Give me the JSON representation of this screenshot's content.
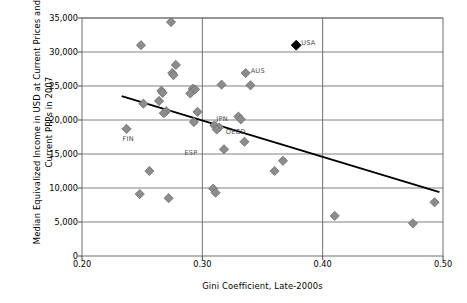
{
  "chart_data": {
    "type": "scatter",
    "title": "",
    "xlabel": "Gini Coefficient, Late-2000s",
    "ylabel": "Median Equivalized Income in USD at Current Prices and Current PPPs in 2007",
    "xlim": [
      0.2,
      0.5
    ],
    "ylim": [
      0,
      35000
    ],
    "xticks": [
      "0.20",
      "0.30",
      "0.40",
      "0.50"
    ],
    "xtick_values": [
      0.2,
      0.3,
      0.4,
      0.5
    ],
    "yticks": [
      "0",
      "5,000",
      "10,000",
      "15,000",
      "20,000",
      "25,000",
      "30,000",
      "35,000"
    ],
    "ytick_values": [
      0,
      5000,
      10000,
      15000,
      20000,
      25000,
      30000,
      35000
    ],
    "grid": "horizontal-and-vertical",
    "legend": "none",
    "marker_shape": "diamond",
    "marker_color": "#8c8c8c",
    "highlight_color": "#000000",
    "trendline_color": "#000000",
    "points": [
      {
        "x": 0.274,
        "y": 34400,
        "label": "",
        "highlight": false
      },
      {
        "x": 0.249,
        "y": 31000,
        "label": "",
        "highlight": false
      },
      {
        "x": 0.378,
        "y": 31000,
        "label": "USA",
        "highlight": true
      },
      {
        "x": 0.278,
        "y": 28100,
        "label": "",
        "highlight": false
      },
      {
        "x": 0.275,
        "y": 26900,
        "label": "",
        "highlight": false
      },
      {
        "x": 0.276,
        "y": 26600,
        "label": "",
        "highlight": false
      },
      {
        "x": 0.336,
        "y": 26900,
        "label": "AUS",
        "highlight": false
      },
      {
        "x": 0.316,
        "y": 25200,
        "label": "",
        "highlight": false
      },
      {
        "x": 0.34,
        "y": 25100,
        "label": "",
        "highlight": false
      },
      {
        "x": 0.266,
        "y": 24300,
        "label": "",
        "highlight": false
      },
      {
        "x": 0.267,
        "y": 24000,
        "label": "",
        "highlight": false
      },
      {
        "x": 0.292,
        "y": 24600,
        "label": "",
        "highlight": false
      },
      {
        "x": 0.294,
        "y": 24500,
        "label": "",
        "highlight": false
      },
      {
        "x": 0.29,
        "y": 23900,
        "label": "",
        "highlight": false
      },
      {
        "x": 0.264,
        "y": 22800,
        "label": "",
        "highlight": false
      },
      {
        "x": 0.251,
        "y": 22400,
        "label": "",
        "highlight": false
      },
      {
        "x": 0.27,
        "y": 21300,
        "label": "",
        "highlight": false
      },
      {
        "x": 0.268,
        "y": 21000,
        "label": "",
        "highlight": false
      },
      {
        "x": 0.296,
        "y": 21200,
        "label": "",
        "highlight": false
      },
      {
        "x": 0.33,
        "y": 20500,
        "label": "",
        "highlight": false
      },
      {
        "x": 0.332,
        "y": 20100,
        "label": "",
        "highlight": false
      },
      {
        "x": 0.293,
        "y": 19700,
        "label": "",
        "highlight": false
      },
      {
        "x": 0.31,
        "y": 19200,
        "label": "JPN",
        "highlight": false
      },
      {
        "x": 0.314,
        "y": 18900,
        "label": "",
        "highlight": false
      },
      {
        "x": 0.312,
        "y": 18600,
        "label": "OECD",
        "highlight": false
      },
      {
        "x": 0.237,
        "y": 18700,
        "label": "FIN",
        "highlight": false
      },
      {
        "x": 0.335,
        "y": 16800,
        "label": "ESP",
        "highlight": false
      },
      {
        "x": 0.318,
        "y": 15700,
        "label": "",
        "highlight": false
      },
      {
        "x": 0.367,
        "y": 14000,
        "label": "",
        "highlight": false
      },
      {
        "x": 0.36,
        "y": 12500,
        "label": "",
        "highlight": false
      },
      {
        "x": 0.256,
        "y": 12500,
        "label": "",
        "highlight": false
      },
      {
        "x": 0.309,
        "y": 9900,
        "label": "",
        "highlight": false
      },
      {
        "x": 0.311,
        "y": 9300,
        "label": "",
        "highlight": false
      },
      {
        "x": 0.248,
        "y": 9100,
        "label": "",
        "highlight": false
      },
      {
        "x": 0.272,
        "y": 8500,
        "label": "",
        "highlight": false
      },
      {
        "x": 0.493,
        "y": 7900,
        "label": "",
        "highlight": false
      },
      {
        "x": 0.41,
        "y": 5900,
        "label": "",
        "highlight": false
      },
      {
        "x": 0.475,
        "y": 4800,
        "label": "",
        "highlight": false
      }
    ],
    "trendline": {
      "x0": 0.233,
      "y0": 23500,
      "x1": 0.497,
      "y1": 9400
    }
  }
}
